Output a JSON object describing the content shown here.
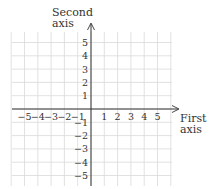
{
  "diagram": {
    "type": "coordinate-plane",
    "y_axis_title_line1": "Second",
    "y_axis_title_line2": "axis",
    "x_axis_title_line1": "First",
    "x_axis_title_line2": "axis",
    "x_ticks_negative": [
      "−5",
      "−4",
      "−3",
      "−2",
      "−1"
    ],
    "x_ticks_positive": [
      "1",
      "2",
      "3",
      "4",
      "5"
    ],
    "y_ticks_positive": [
      "5",
      "4",
      "3",
      "2",
      "1"
    ],
    "y_ticks_negative": [
      "−1",
      "−2",
      "−3",
      "−4",
      "−5"
    ],
    "x_range": [
      -6,
      6
    ],
    "y_range": [
      -6,
      6
    ],
    "grid": true,
    "colors": {
      "grid": "#d9d9d9",
      "axis": "#333333",
      "text": "#333333"
    }
  }
}
